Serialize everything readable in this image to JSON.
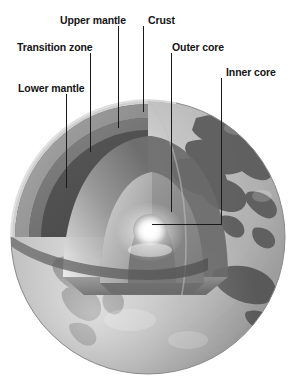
{
  "figure": {
    "type": "cutaway-sphere-diagram",
    "canvas": {
      "width": 297,
      "height": 379,
      "background": "#ffffff"
    },
    "sphere": {
      "center_x": 148,
      "center_y": 237,
      "radius": 137,
      "surface_description": "shaded globe showing Asia and surrounding oceans in grayscale",
      "ocean_color": "#b4b4b4",
      "land_color": "#5e5e5e",
      "highlight_color": "#e8e8e8"
    },
    "labels": [
      {
        "id": "upper-mantle",
        "text": "Upper mantle",
        "x": 60,
        "y": 14
      },
      {
        "id": "crust",
        "text": "Crust",
        "x": 148,
        "y": 14
      },
      {
        "id": "transition-zone",
        "text": "Transition zone",
        "x": 17,
        "y": 41
      },
      {
        "id": "outer-core",
        "text": "Outer core",
        "x": 172,
        "y": 41
      },
      {
        "id": "inner-core",
        "text": "Inner core",
        "x": 226,
        "y": 66
      },
      {
        "id": "lower-mantle",
        "text": "Lower mantle",
        "x": 18,
        "y": 82
      }
    ],
    "leader_lines": [
      {
        "id": "leader-upper-mantle",
        "points": "118,26 118,128"
      },
      {
        "id": "leader-crust",
        "points": "143,26 143,112"
      },
      {
        "id": "leader-transition-zone",
        "points": "90,53 90,152"
      },
      {
        "id": "leader-outer-core",
        "points": "171,53 171,212"
      },
      {
        "id": "leader-inner-core",
        "points": "221,78 221,224 152,224"
      },
      {
        "id": "leader-lower-mantle",
        "points": "66,94 66,188"
      }
    ],
    "layers": [
      {
        "name": "Crust",
        "color": "#9a9a9a",
        "note": "thin bright outer shell at cut face"
      },
      {
        "name": "Upper mantle",
        "color": "#6d6d6d",
        "note": "band just beneath crust"
      },
      {
        "name": "Transition zone",
        "color": "#7d7d7d",
        "note": "lighter band between upper and lower mantle"
      },
      {
        "name": "Lower mantle",
        "color": "#575757",
        "note": "broad dark wedge face"
      },
      {
        "name": "Outer core",
        "color": "#8c8c8c",
        "note": "inner arch, mid gray"
      },
      {
        "name": "Inner core",
        "color": "#ffffff",
        "note": "bright white glowing center"
      }
    ],
    "line_color": "#1a1a1a",
    "line_width": 1
  }
}
